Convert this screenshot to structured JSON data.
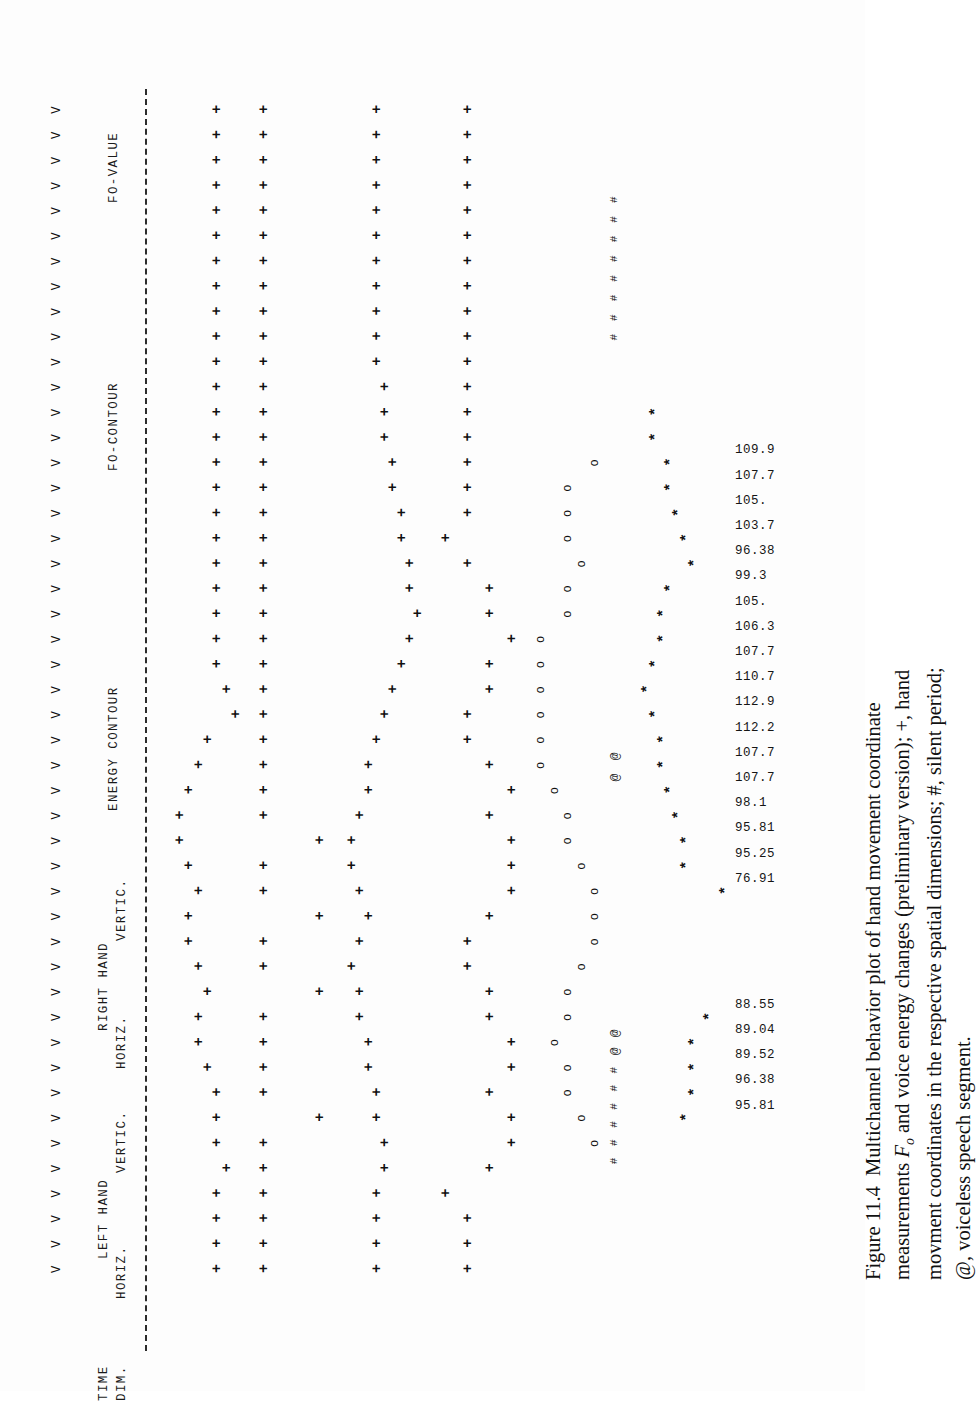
{
  "figure": {
    "number": "Figure 11.4",
    "caption_part1": "Multichannel behavior plot of hand movement coordinate measurements",
    "caption_italic": "F",
    "caption_sub": "o",
    "caption_part2": " and voice energy changes (preliminary version); +, hand movment coordinates in the",
    "caption_part3": "respective spatial dimensions; #, silent period; @, voiceless speech segment."
  },
  "headers": {
    "time": "TIME",
    "dim": "DIM.",
    "left_hand": "LEFT HAND",
    "left_horiz": "HORIZ.",
    "left_vertic": "VERTIC.",
    "right_hand": "RIGHT HAND",
    "right_horiz": "HORIZ.",
    "right_vertic": "VERTIC.",
    "energy_contour": "ENERGY CONTOUR",
    "f0_contour": "FO-CONTOUR",
    "f0_value": "FO-VALUE"
  },
  "glyphs": {
    "plus": "+",
    "star": "*",
    "circle": "o",
    "hash": "#",
    "at": "@",
    "vee": "V"
  },
  "chart_data": {
    "type": "scatter",
    "title": "Multichannel behavior plot",
    "xlabel": "TIME DIM.",
    "ylabel": "",
    "grid": false,
    "legend": [
      "+, hand movment coordinates",
      "#, silent period",
      "@, voiceless speech segment"
    ],
    "n_time_steps": 47,
    "time_marks": [
      "V",
      "V",
      "V",
      "V",
      "V",
      "V",
      "V",
      "V",
      "V",
      "V",
      "V",
      "V",
      "V",
      "V",
      "V",
      "V",
      "V",
      "V",
      "V",
      "V",
      "V",
      "V",
      "V",
      "V",
      "V",
      "V",
      "V",
      "V",
      "V",
      "V",
      "V",
      "V",
      "V",
      "V",
      "V",
      "V",
      "V",
      "V",
      "V",
      "V",
      "V",
      "V",
      "V",
      "V",
      "V",
      "V",
      "V"
    ],
    "series": [
      {
        "name": "LEFT HAND HORIZ.",
        "marker": "+",
        "x": [
          1,
          2,
          3,
          4,
          5,
          6,
          7,
          8,
          9,
          10,
          11,
          12,
          13,
          14,
          15,
          16,
          17,
          18,
          19,
          20,
          21,
          22,
          23,
          24,
          25,
          26,
          27,
          28,
          29,
          30,
          31,
          32,
          33,
          34,
          35,
          36,
          37,
          38,
          39,
          40,
          41,
          42,
          43,
          44,
          45,
          46,
          47
        ],
        "y": [
          3,
          3,
          3,
          3,
          2,
          3,
          3,
          3,
          4,
          5,
          5,
          4,
          5,
          6,
          6,
          5,
          6,
          7,
          7,
          6,
          5,
          4,
          1,
          2,
          3,
          3,
          3,
          3,
          3,
          3,
          3,
          3,
          3,
          3,
          3,
          3,
          3,
          3,
          3,
          3,
          3,
          3,
          3,
          3,
          3,
          3,
          3
        ]
      },
      {
        "name": "LEFT HAND VERTIC.",
        "marker": "+",
        "x": [
          1,
          2,
          3,
          4,
          5,
          6,
          7,
          8,
          9,
          10,
          11,
          12,
          13,
          14,
          15,
          16,
          17,
          18,
          19,
          20,
          21,
          22,
          23,
          24,
          25,
          26,
          27,
          28,
          29,
          30,
          31,
          32,
          33,
          34,
          35,
          36,
          37,
          38,
          39,
          40,
          41,
          42,
          43,
          44,
          45,
          46,
          47
        ],
        "y": [
          5,
          5,
          5,
          5,
          5,
          5,
          4,
          5,
          5,
          5,
          5,
          4,
          5,
          5,
          4,
          5,
          5,
          4,
          5,
          5,
          5,
          5,
          5,
          5,
          5,
          5,
          5,
          5,
          5,
          5,
          5,
          5,
          5,
          5,
          5,
          5,
          5,
          5,
          5,
          5,
          5,
          5,
          5,
          5,
          5,
          5,
          5
        ]
      },
      {
        "name": "RIGHT HAND HORIZ.",
        "marker": "+",
        "x": [
          1,
          2,
          3,
          4,
          5,
          6,
          7,
          8,
          9,
          10,
          11,
          12,
          13,
          14,
          15,
          16,
          17,
          18,
          19,
          20,
          21,
          22,
          23,
          24,
          25,
          26,
          27,
          28,
          29,
          30,
          31,
          32,
          33,
          34,
          35,
          36,
          37,
          38,
          39,
          40,
          41,
          42,
          43,
          44,
          45,
          46,
          47
        ],
        "y": [
          7,
          7,
          7,
          7,
          6,
          6,
          7,
          7,
          8,
          8,
          9,
          9,
          10,
          9,
          8,
          9,
          10,
          10,
          9,
          8,
          8,
          7,
          6,
          5,
          4,
          3,
          2,
          3,
          3,
          4,
          4,
          5,
          5,
          6,
          6,
          6,
          7,
          7,
          7,
          7,
          7,
          7,
          7,
          7,
          7,
          7,
          7
        ]
      },
      {
        "name": "RIGHT HAND VERTIC.",
        "marker": "+",
        "x": [
          1,
          2,
          3,
          4,
          5,
          6,
          7,
          8,
          9,
          10,
          11,
          12,
          13,
          14,
          15,
          16,
          17,
          18,
          19,
          20,
          21,
          22,
          23,
          24,
          25,
          26,
          27,
          28,
          29,
          30,
          31,
          32,
          33,
          34,
          35,
          36,
          37,
          38,
          39,
          40,
          41,
          42,
          43,
          44,
          45,
          46,
          47
        ],
        "y": [
          8,
          8,
          8,
          9,
          7,
          6,
          6,
          7,
          6,
          6,
          7,
          7,
          8,
          8,
          7,
          6,
          6,
          6,
          7,
          6,
          7,
          8,
          8,
          7,
          7,
          6,
          7,
          7,
          8,
          9,
          8,
          8,
          8,
          8,
          8,
          8,
          8,
          8,
          8,
          8,
          8,
          8,
          8,
          8,
          8,
          8,
          8
        ]
      },
      {
        "name": "ENERGY CONTOUR",
        "marker": "o",
        "x": [
          6,
          7,
          8,
          9,
          10,
          11,
          12,
          13,
          14,
          15,
          16,
          17,
          18,
          19,
          20,
          21,
          22,
          23,
          24,
          25,
          26,
          27,
          28,
          29,
          30,
          31,
          32,
          33,
          34,
          35,
          36,
          37
        ],
        "y": [
          2,
          3,
          4,
          4,
          5,
          4,
          4,
          3,
          2,
          2,
          2,
          3,
          4,
          4,
          5,
          6,
          6,
          6,
          6,
          6,
          6,
          4,
          4,
          3,
          4,
          4,
          4,
          2,
          null,
          null,
          null,
          null
        ]
      },
      {
        "name": "FO-CONTOUR",
        "marker": "*",
        "x": [
          7,
          8,
          9,
          10,
          11,
          16,
          17,
          18,
          19,
          20,
          21,
          22,
          23,
          24,
          25,
          26,
          27,
          28,
          29,
          30,
          31,
          32,
          33,
          34,
          35
        ],
        "y": [
          7,
          6,
          6,
          6,
          4,
          2,
          7,
          7,
          8,
          9,
          10,
          10,
          11,
          12,
          11,
          10,
          10,
          9,
          6,
          7,
          8,
          9,
          9,
          11,
          11
        ]
      }
    ],
    "f0_values_group1": [
      "95.81",
      "96.38",
      "89.52",
      "89.04",
      "88.55"
    ],
    "f0_values_group2": [
      "76.91",
      "95.25",
      "95.81",
      "98.1",
      "107.7",
      "107.7",
      "112.2",
      "112.9",
      "110.7",
      "107.7",
      "106.3",
      "105.",
      "99.3",
      "96.38",
      "103.7",
      "105.",
      "107.7",
      "109.9"
    ],
    "silence_markers_group1": [
      "#",
      "#",
      "#",
      "#",
      "#",
      "#",
      "@",
      "@"
    ],
    "silence_markers_group2": [
      "@",
      "@"
    ],
    "silence_markers_group3": [
      "#",
      "#",
      "#",
      "#",
      "#",
      "#",
      "#",
      "#"
    ]
  }
}
